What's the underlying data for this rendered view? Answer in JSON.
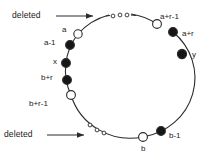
{
  "diagram": {
    "stroke_color": "#2b2b2b",
    "fill_color": "#161616",
    "open_fill": "#ffffff",
    "background": "#ffffff",
    "annotations": [
      {
        "name": "deleted-top",
        "text": "deleted"
      },
      {
        "name": "deleted-bottom",
        "text": "deleted"
      }
    ],
    "nodes": [
      {
        "id": "a",
        "label": "a",
        "type": "open",
        "cx": 78,
        "cy": 34,
        "r": 4.2,
        "lx": 62,
        "ly": 26
      },
      {
        "id": "a-1",
        "label": "a-1",
        "type": "filled",
        "cx": 70,
        "cy": 45,
        "r": 4.4,
        "lx": 44,
        "ly": 39
      },
      {
        "id": "x",
        "label": "x",
        "type": "filled",
        "cx": 66,
        "cy": 63,
        "r": 4.4,
        "lx": 53,
        "ly": 58
      },
      {
        "id": "b+r",
        "label": "b+r",
        "type": "filled",
        "cx": 67,
        "cy": 80,
        "r": 4.4,
        "lx": 41,
        "ly": 74
      },
      {
        "id": "b+r-1",
        "label": "b+r-1",
        "type": "open",
        "cx": 71,
        "cy": 95,
        "r": 4.4,
        "lx": 29,
        "ly": 100
      },
      {
        "id": "b",
        "label": "b",
        "type": "open",
        "cx": 143,
        "cy": 137,
        "r": 4.4,
        "lx": 141,
        "ly": 145
      },
      {
        "id": "b-1",
        "label": "b-1",
        "type": "filled",
        "cx": 161,
        "cy": 131,
        "r": 4.4,
        "lx": 169,
        "ly": 132
      },
      {
        "id": "y",
        "label": "y",
        "type": "filled",
        "cx": 182,
        "cy": 54,
        "r": 4.6,
        "lx": 192,
        "ly": 51
      },
      {
        "id": "a+r",
        "label": "a+r",
        "type": "filled",
        "cx": 173,
        "cy": 32,
        "r": 4.4,
        "lx": 182,
        "ly": 30
      },
      {
        "id": "a+r-1",
        "label": "a+r-1",
        "type": "open",
        "cx": 157,
        "cy": 24,
        "r": 4.4,
        "lx": 160,
        "ly": 13
      }
    ],
    "ellipsis_top": {
      "name": "deleted-run-top",
      "marks": [
        {
          "cx": 113,
          "cy": 16,
          "r": 1.9
        },
        {
          "cx": 120,
          "cy": 15,
          "r": 1.9
        },
        {
          "cx": 127,
          "cy": 15,
          "r": 1.9
        }
      ]
    },
    "ellipsis_bottom": {
      "name": "deleted-run-bottom",
      "marks": [
        {
          "cx": 90,
          "cy": 125,
          "r": 1.9
        },
        {
          "cx": 97,
          "cy": 130,
          "r": 1.9
        },
        {
          "cx": 104,
          "cy": 133,
          "r": 1.9
        }
      ]
    }
  }
}
